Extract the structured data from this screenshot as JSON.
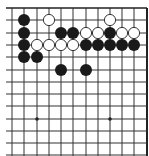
{
  "board": {
    "description": "Go board fragment (top-right corner region), top and right edges visible",
    "colors": {
      "background": "#ffffff",
      "line": "#333333",
      "edge": "#222222",
      "black_stone": "#1a1a1a",
      "white_stone": "#ffffff",
      "white_stone_outline": "#222222",
      "star_point": "#222222"
    },
    "columns": 12,
    "rows": 13,
    "col_x": [
      12,
      24,
      37,
      49,
      61,
      73,
      86,
      98,
      110,
      122,
      134,
      147
    ],
    "row_y": [
      8,
      20,
      33,
      45,
      57,
      70,
      82,
      94,
      106,
      119,
      131,
      143,
      155
    ],
    "star_points": [
      {
        "col": 3,
        "row": 10
      },
      {
        "col": 9,
        "row": 10
      }
    ],
    "stones": [
      {
        "color": "black",
        "col": 2,
        "row": 2
      },
      {
        "color": "white",
        "col": 4,
        "row": 2
      },
      {
        "color": "white",
        "col": 9,
        "row": 2
      },
      {
        "color": "black",
        "col": 2,
        "row": 3
      },
      {
        "color": "black",
        "col": 5,
        "row": 3
      },
      {
        "color": "black",
        "col": 6,
        "row": 3
      },
      {
        "color": "white",
        "col": 7,
        "row": 3
      },
      {
        "color": "white",
        "col": 8,
        "row": 3
      },
      {
        "color": "black",
        "col": 9,
        "row": 3
      },
      {
        "color": "white",
        "col": 10,
        "row": 3
      },
      {
        "color": "white",
        "col": 11,
        "row": 3
      },
      {
        "color": "black",
        "col": 2,
        "row": 4
      },
      {
        "color": "white",
        "col": 3,
        "row": 4
      },
      {
        "color": "white",
        "col": 4,
        "row": 4
      },
      {
        "color": "white",
        "col": 5,
        "row": 4
      },
      {
        "color": "white",
        "col": 6,
        "row": 4
      },
      {
        "color": "black",
        "col": 7,
        "row": 4
      },
      {
        "color": "black",
        "col": 8,
        "row": 4
      },
      {
        "color": "black",
        "col": 9,
        "row": 4
      },
      {
        "color": "black",
        "col": 10,
        "row": 4
      },
      {
        "color": "black",
        "col": 11,
        "row": 4
      },
      {
        "color": "black",
        "col": 2,
        "row": 5
      },
      {
        "color": "black",
        "col": 3,
        "row": 5
      },
      {
        "color": "black",
        "col": 5,
        "row": 6
      },
      {
        "color": "black",
        "col": 7,
        "row": 6
      }
    ]
  }
}
